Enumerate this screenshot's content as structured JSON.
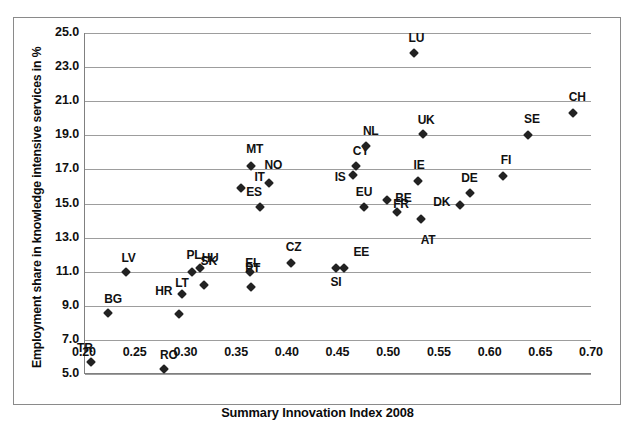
{
  "chart_data": {
    "type": "scatter",
    "title": "",
    "xlabel": "Summary Innovation Index 2008",
    "ylabel": "Employment share in knowledge intensive services in %",
    "xlim": [
      0.2,
      0.7
    ],
    "ylim": [
      5.0,
      25.0
    ],
    "xticks": [
      "0.20",
      "0.25",
      "0.30",
      "0.35",
      "0.40",
      "0.45",
      "0.50",
      "0.55",
      "0.60",
      "0.65",
      "0.70"
    ],
    "yticks": [
      "5.0",
      "7.0",
      "9.0",
      "11.0",
      "13.0",
      "15.0",
      "17.0",
      "19.0",
      "21.0",
      "23.0",
      "25.0"
    ],
    "grid": "horizontal",
    "legend": "none",
    "marker_color": "#222222",
    "grid_color": "#9d9d9d",
    "points": [
      {
        "label": "TR",
        "x": 0.206,
        "y": 5.7,
        "lx": -14,
        "ly": -20
      },
      {
        "label": "BG",
        "x": 0.223,
        "y": 8.6,
        "lx": -4,
        "ly": -20
      },
      {
        "label": "LV",
        "x": 0.24,
        "y": 11.0,
        "lx": -4,
        "ly": -20
      },
      {
        "label": "RO",
        "x": 0.278,
        "y": 5.3,
        "lx": -4,
        "ly": -20
      },
      {
        "label": "LT",
        "x": 0.293,
        "y": 8.5,
        "lx": -4,
        "ly": -37
      },
      {
        "label": "HR",
        "x": 0.296,
        "y": 9.7,
        "lx": -27,
        "ly": -9
      },
      {
        "label": "PL",
        "x": 0.306,
        "y": 11.0,
        "lx": -6,
        "ly": -23
      },
      {
        "label": "SK",
        "x": 0.313,
        "y": 11.2,
        "lx": 1,
        "ly": -13
      },
      {
        "label": "HU",
        "x": 0.317,
        "y": 10.2,
        "lx": -2,
        "ly": -33
      },
      {
        "label": "ES",
        "x": 0.354,
        "y": 15.9,
        "lx": 5,
        "ly": -2
      },
      {
        "label": "PT",
        "x": 0.363,
        "y": 11.0,
        "lx": -5,
        "ly": -10
      },
      {
        "label": "EL",
        "x": 0.364,
        "y": 10.1,
        "lx": -6,
        "ly": -30
      },
      {
        "label": "MT",
        "x": 0.364,
        "y": 17.2,
        "lx": -5,
        "ly": -23
      },
      {
        "label": "IT",
        "x": 0.373,
        "y": 14.8,
        "lx": -6,
        "ly": -36
      },
      {
        "label": "NO",
        "x": 0.381,
        "y": 16.2,
        "lx": -4,
        "ly": -24
      },
      {
        "label": "CZ",
        "x": 0.403,
        "y": 11.5,
        "lx": -5,
        "ly": -22
      },
      {
        "label": "SI",
        "x": 0.448,
        "y": 11.2,
        "lx": -6,
        "ly": 8
      },
      {
        "label": "EE",
        "x": 0.455,
        "y": 11.2,
        "lx": 10,
        "ly": -22
      },
      {
        "label": "IS",
        "x": 0.464,
        "y": 16.7,
        "lx": -18,
        "ly": -4
      },
      {
        "label": "CY",
        "x": 0.467,
        "y": 17.2,
        "lx": -3,
        "ly": -21
      },
      {
        "label": "EU",
        "x": 0.475,
        "y": 14.8,
        "lx": -8,
        "ly": -21
      },
      {
        "label": "NL",
        "x": 0.477,
        "y": 18.4,
        "lx": -3,
        "ly": -21
      },
      {
        "label": "FR",
        "x": 0.498,
        "y": 15.2,
        "lx": 6,
        "ly": -2
      },
      {
        "label": "BE",
        "x": 0.508,
        "y": 14.5,
        "lx": -2,
        "ly": -20
      },
      {
        "label": "UK",
        "x": 0.533,
        "y": 19.1,
        "lx": -5,
        "ly": -20
      },
      {
        "label": "LU",
        "x": 0.524,
        "y": 23.8,
        "lx": -5,
        "ly": -21
      },
      {
        "label": "IE",
        "x": 0.528,
        "y": 16.3,
        "lx": -4,
        "ly": -22
      },
      {
        "label": "AT",
        "x": 0.531,
        "y": 14.1,
        "lx": 0,
        "ly": 15
      },
      {
        "label": "DK",
        "x": 0.57,
        "y": 14.9,
        "lx": -27,
        "ly": -9
      },
      {
        "label": "DE",
        "x": 0.58,
        "y": 15.6,
        "lx": -9,
        "ly": -21
      },
      {
        "label": "FI",
        "x": 0.612,
        "y": 16.6,
        "lx": -2,
        "ly": -22
      },
      {
        "label": "SE",
        "x": 0.637,
        "y": 19.0,
        "lx": -4,
        "ly": -22
      },
      {
        "label": "CH",
        "x": 0.681,
        "y": 20.3,
        "lx": -4,
        "ly": -22
      }
    ]
  }
}
